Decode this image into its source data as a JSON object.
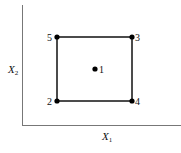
{
  "diagram": {
    "type": "experimental-design-square",
    "axes": {
      "x_label": "X",
      "x_subscript": "1",
      "y_label": "X",
      "y_subscript": "2"
    },
    "points": [
      {
        "id": "1",
        "label": "1",
        "x": 95,
        "y": 69,
        "position": "center"
      },
      {
        "id": "2",
        "label": "2",
        "x": 57,
        "y": 101,
        "position": "bottom-left"
      },
      {
        "id": "3",
        "label": "3",
        "x": 132,
        "y": 37,
        "position": "top-right"
      },
      {
        "id": "4",
        "label": "4",
        "x": 132,
        "y": 101,
        "position": "bottom-right"
      },
      {
        "id": "5",
        "label": "5",
        "x": 57,
        "y": 37,
        "position": "top-left"
      }
    ],
    "colors": {
      "axis": "#777777",
      "square": "#111111",
      "point": "#000000"
    }
  }
}
